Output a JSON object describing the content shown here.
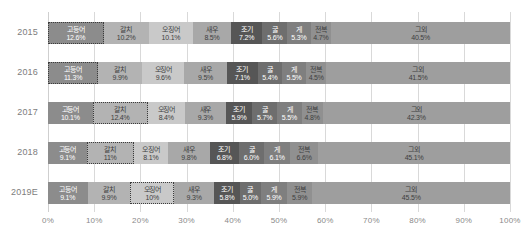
{
  "chart_data": {
    "type": "bar",
    "orientation": "horizontal",
    "stacked": true,
    "normalized_percent": true,
    "title": "",
    "subtitle": "",
    "xlabel": "",
    "ylabel": "",
    "xlim": [
      0,
      100
    ],
    "xticks": [
      "0%",
      "10%",
      "20%",
      "30%",
      "40%",
      "50%",
      "60%",
      "70%",
      "80%",
      "90%",
      "100%"
    ],
    "xtick_values": [
      0,
      10,
      20,
      30,
      40,
      50,
      60,
      70,
      80,
      90,
      100
    ],
    "grid": true,
    "legend": "none",
    "categories": [
      "2015",
      "2016",
      "2017",
      "2018",
      "2019E"
    ],
    "series": [
      {
        "name": "고등어",
        "color": "#8c8c8c",
        "values": [
          12.6,
          11.3,
          10.1,
          9.1,
          9.1
        ],
        "labels": [
          "12.6%",
          "11.3%",
          "10.1%",
          "9.1%",
          "9.1%"
        ]
      },
      {
        "name": "갈치",
        "color": "#b3b3b3",
        "values": [
          10.2,
          9.9,
          12.4,
          11.0,
          9.9
        ],
        "labels": [
          "10.2%",
          "9.9%",
          "12.4%",
          "11%",
          "9.9%"
        ]
      },
      {
        "name": "오징어",
        "color": "#c9c9c9",
        "values": [
          10.1,
          9.6,
          8.4,
          8.1,
          10.0
        ],
        "labels": [
          "10.1%",
          "9.6%",
          "8.4%",
          "8.1%",
          "10%"
        ]
      },
      {
        "name": "새우",
        "color": "#a8a8a8",
        "values": [
          8.5,
          9.5,
          9.3,
          9.8,
          9.3
        ],
        "labels": [
          "8.5%",
          "9.5%",
          "9.3%",
          "9.8%",
          "9.3%"
        ]
      },
      {
        "name": "조기",
        "color": "#565656",
        "values": [
          7.2,
          7.1,
          5.9,
          6.8,
          5.8
        ],
        "labels": [
          "7.2%",
          "7.1%",
          "5.9%",
          "6.8%",
          "5.8%"
        ]
      },
      {
        "name": "굴",
        "color": "#6e6e6e",
        "values": [
          5.6,
          5.4,
          5.7,
          6.0,
          5.0
        ],
        "labels": [
          "5.6%",
          "5.4%",
          "5.7%",
          "6.0%",
          "5.0%"
        ]
      },
      {
        "name": "게",
        "color": "#7f7f7f",
        "values": [
          5.3,
          5.5,
          5.5,
          6.1,
          5.9
        ],
        "labels": [
          "5.3%",
          "5.5%",
          "5.5%",
          "6.1%",
          "5.9%"
        ]
      },
      {
        "name": "전복",
        "color": "#909090",
        "values": [
          4.7,
          4.5,
          4.8,
          6.6,
          5.9
        ],
        "labels": [
          "4.7%",
          "4.5%",
          "4.8%",
          "6.6%",
          "5.9%"
        ]
      },
      {
        "name": "그외",
        "color": "#9e9e9e",
        "values": [
          40.5,
          41.5,
          42.3,
          45.1,
          45.5
        ],
        "labels": [
          "40.5%",
          "41.5%",
          "42.3%",
          "45.1%",
          "45.5%"
        ]
      }
    ],
    "highlighted_cells": [
      {
        "row": 0,
        "series": 0
      },
      {
        "row": 1,
        "series": 0
      },
      {
        "row": 2,
        "series": 1
      },
      {
        "row": 3,
        "series": 1
      },
      {
        "row": 4,
        "series": 2
      }
    ],
    "label_colors": {
      "on_light": "#404040",
      "on_dark": "#ffffff"
    },
    "axis_text_color": "#8a8a8a",
    "ytick_text_color": "#7d7d7d",
    "gridline_color": "#d9d9d9",
    "background": "#ffffff"
  }
}
